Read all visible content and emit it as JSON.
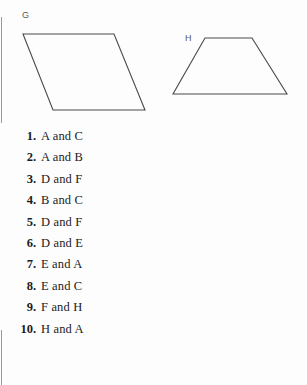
{
  "figures": {
    "shapes": [
      {
        "id": "parallelogram-g",
        "label": "G",
        "points": "23,34 114,34 145,110 53,110"
      },
      {
        "id": "trapezoid-h",
        "label": "H",
        "points": "205,38 252,38 287,94 173,94"
      }
    ],
    "stroke_color": "#4a4a4a",
    "label_color": "#5a5a5a"
  },
  "answers": {
    "items": [
      {
        "number": "1.",
        "text": "A and C"
      },
      {
        "number": "2.",
        "text": "A and B"
      },
      {
        "number": "3.",
        "text": "D and F"
      },
      {
        "number": "4.",
        "text": "B and C"
      },
      {
        "number": "5.",
        "text": "D and F"
      },
      {
        "number": "6.",
        "text": "D and E"
      },
      {
        "number": "7.",
        "text": "E and A"
      },
      {
        "number": "8.",
        "text": "E and C"
      },
      {
        "number": "9.",
        "text": "F and H"
      },
      {
        "number": "10.",
        "text": "H and A"
      }
    ]
  },
  "page": {
    "background_color": "#fdfdfd",
    "text_color": "#1b1b1b",
    "edge_line_color": "#9a9a9a"
  }
}
